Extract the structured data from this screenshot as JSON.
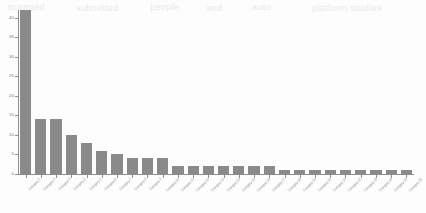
{
  "page": {
    "background_color": "#fdfdfd",
    "bar_color": "#8a8a8a",
    "axis_color": "#8d8d8d",
    "tick_label_color": "#777777",
    "category_label_color": "#8e8e8e"
  },
  "artifacts": {
    "top_ghost_text": [
      "scanned",
      "submitted",
      "people",
      "and",
      "auto",
      "platform studies"
    ]
  },
  "chart_data": {
    "type": "bar",
    "title": "",
    "subtitle": "",
    "xlabel": "",
    "ylabel": "",
    "ylim": [
      0,
      42
    ],
    "grid": false,
    "legend": false,
    "orientation": "vertical",
    "sorted": "descending",
    "yticks": [
      0,
      5,
      10,
      15,
      20,
      25,
      30,
      35,
      40
    ],
    "ytick_labels": [
      "0",
      "5",
      "10",
      "15",
      "20",
      "25",
      "30",
      "35",
      "40"
    ],
    "categories": [
      "Category 1",
      "Category 2",
      "Category 3",
      "Category 4",
      "Category 5",
      "Category 6",
      "Category 7",
      "Category 8",
      "Category 9",
      "Category 10",
      "Category 11",
      "Category 12",
      "Category 13",
      "Category 14",
      "Category 15",
      "Category 16",
      "Category 17",
      "Category 18",
      "Category 19",
      "Category 20",
      "Category 21",
      "Category 22",
      "Category 23",
      "Category 24",
      "Category 25",
      "Category 26"
    ],
    "values": [
      42,
      14,
      14,
      10,
      8,
      6,
      5,
      4,
      4,
      4,
      2,
      2,
      2,
      2,
      2,
      2,
      2,
      1,
      1,
      1,
      1,
      1,
      1,
      1,
      1,
      1
    ]
  }
}
